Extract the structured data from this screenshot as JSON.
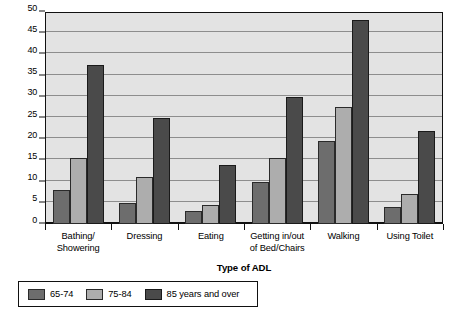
{
  "chart_data": {
    "type": "bar",
    "title": "",
    "xlabel": "Type of ADL",
    "ylabel": "",
    "ylim": [
      0,
      50
    ],
    "yticks": [
      0,
      5,
      10,
      15,
      20,
      25,
      30,
      35,
      40,
      45,
      50
    ],
    "grid": true,
    "legend_position": "bottom-left",
    "categories": [
      "Bathing/\nShowering",
      "Dressing",
      "Eating",
      "Getting in/out\nof Bed/Chairs",
      "Walking",
      "Using Toilet"
    ],
    "category_lines": [
      [
        "Bathing/",
        "Showering"
      ],
      [
        "Dressing",
        ""
      ],
      [
        "Eating",
        ""
      ],
      [
        "Getting in/out",
        "of Bed/Chairs"
      ],
      [
        "Walking",
        ""
      ],
      [
        "Using Toilet",
        ""
      ]
    ],
    "series": [
      {
        "name": "65-74",
        "color": "#6d6d6d",
        "values": [
          8,
          5,
          3,
          10,
          19.5,
          4
        ]
      },
      {
        "name": "75-84",
        "color": "#adadad",
        "values": [
          15.5,
          11,
          4.5,
          15.5,
          27.5,
          7
        ]
      },
      {
        "name": "85 years and over",
        "color": "#4a4a4a",
        "values": [
          37.5,
          25,
          14,
          30,
          48,
          22
        ]
      }
    ]
  },
  "legend": {
    "items": [
      {
        "label": "65-74"
      },
      {
        "label": "75-84"
      },
      {
        "label": "85 years and over"
      }
    ]
  },
  "axis": {
    "x_title": "Type of ADL"
  },
  "colors": {
    "plot_background": "#e3e3e3",
    "frame": "#111111",
    "gridline": "#8d8d8d",
    "series_65_74": "#6d6d6d",
    "series_75_84": "#adadad",
    "series_85_over": "#4a4a4a"
  }
}
